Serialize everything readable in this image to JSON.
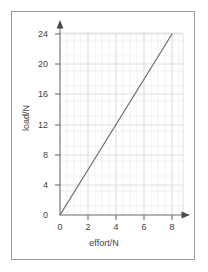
{
  "chart_data": {
    "type": "line",
    "title": "",
    "xlabel": "effort/N",
    "ylabel": "load/N",
    "xlim": [
      0,
      8.8
    ],
    "ylim": [
      0,
      25.5
    ],
    "xticks": [
      0,
      2,
      4,
      6,
      8
    ],
    "xtick_labels": [
      "0",
      "2",
      "4",
      "6",
      "8"
    ],
    "yticks": [
      0,
      4,
      8,
      12,
      16,
      20,
      24
    ],
    "ytick_labels": [
      "0",
      "4",
      "8",
      "12",
      "16",
      "20",
      "24"
    ],
    "grid": true,
    "grid_minor": true,
    "legend": null,
    "series": [
      {
        "name": "load vs effort",
        "x": [
          0,
          8
        ],
        "y": [
          0,
          24
        ],
        "slope": 3,
        "intercept": 0,
        "color": "#6b6b6b",
        "linewidth": 1.2,
        "marker": "none"
      }
    ],
    "axis_arrows": {
      "x_axis_arrow": true,
      "y_axis_arrow": true
    },
    "colors": {
      "axis": "#6b6b6b",
      "grid_major": "#dcdce4",
      "grid_minor": "#eeeef3",
      "line": "#6b6b6b",
      "text": "#3f3f3f",
      "frame": "#9a9a9a",
      "background": "#ffffff"
    }
  }
}
